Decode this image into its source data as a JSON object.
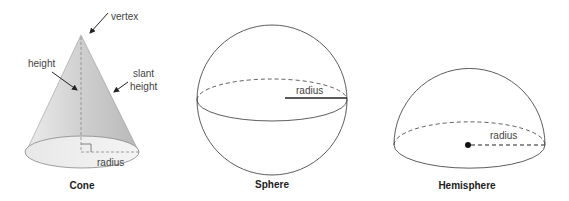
{
  "figures": {
    "cone": {
      "caption": "Cone",
      "labels": {
        "vertex": "vertex",
        "height": "height",
        "slant1": "slant",
        "slant2": "height",
        "radius": "radius"
      }
    },
    "sphere": {
      "caption": "Sphere",
      "labels": {
        "radius": "radius"
      }
    },
    "hemisphere": {
      "caption": "Hemisphere",
      "labels": {
        "radius": "radius"
      }
    }
  },
  "colors": {
    "stroke": "#333333",
    "cone_fill_light": "#e6e6e6",
    "cone_fill_dark": "#bdbdbd",
    "dashed": "#888888"
  }
}
